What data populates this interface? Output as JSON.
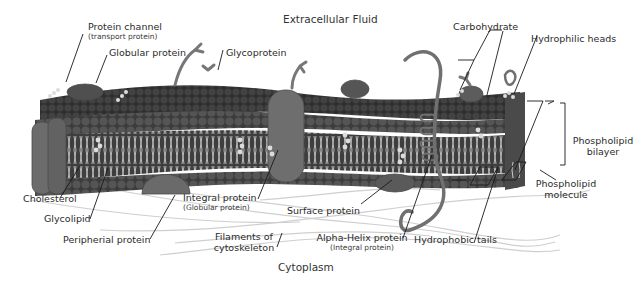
{
  "diagram": {
    "regions": {
      "top": "Extracellular Fluid",
      "bottom": "Cytoplasm"
    },
    "labels": {
      "protein_channel": {
        "main": "Protein channel",
        "sub": "(transport protein)"
      },
      "globular_protein": {
        "main": "Globular protein"
      },
      "glycoprotein": {
        "main": "Glycoprotein"
      },
      "carbohydrate": {
        "main": "Carbohydrate"
      },
      "hydrophilic_heads": {
        "main": "Hydrophilic heads"
      },
      "phospholipid_bilayer": {
        "line1": "Phospholipid",
        "line2": "bilayer"
      },
      "phospholipid_molecule": {
        "line1": "Phospholipid",
        "line2": "molecule"
      },
      "cholesterol": {
        "main": "Cholesterol"
      },
      "glycolipid": {
        "main": "Glycolipid"
      },
      "peripheral_protein": {
        "main": "Peripherial protein"
      },
      "integral_protein": {
        "main": "Integral protein",
        "sub": "(Globular protein)"
      },
      "surface_protein": {
        "main": "Surface protein"
      },
      "filaments": {
        "line1": "Filaments of",
        "line2": "cytoskeleton"
      },
      "alpha_helix": {
        "main": "Alpha-Helix protein",
        "sub": "(Integral protein)"
      },
      "hydrophobic_tails": {
        "main": "Hydrophobic tails"
      }
    },
    "colors": {
      "head_dark": "#3a3a3a",
      "head_mid": "#5a5a5a",
      "core": "#4a4a4a",
      "tail": "#d8d8d8",
      "protein": "#6a6a6a",
      "leader": "#1a1a1a",
      "filament": "#c8c8c8"
    }
  }
}
